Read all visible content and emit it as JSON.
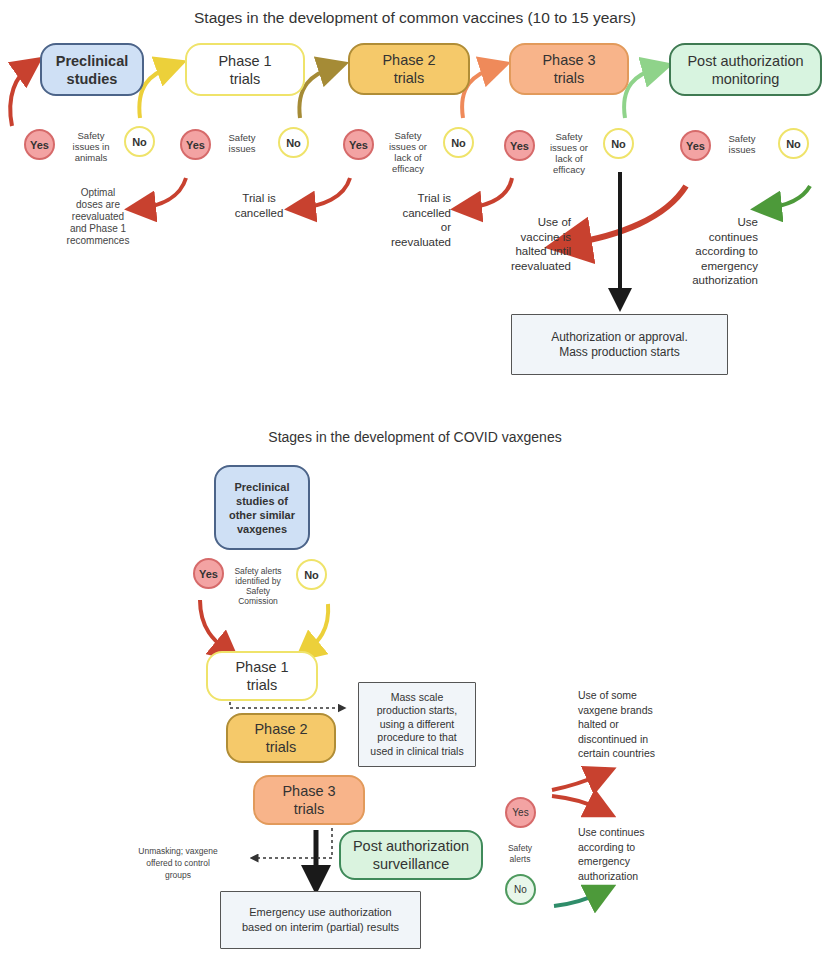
{
  "top": {
    "title": "Stages in the development of common vaccines (10 to 15 years)",
    "stages": [
      {
        "label": "Preclinical studies",
        "line1": "Preclinical",
        "line2": "studies"
      },
      {
        "label": "Phase 1 trials",
        "line1": "Phase 1",
        "line2": "trials"
      },
      {
        "label": "Phase 2 trials",
        "line1": "Phase 2",
        "line2": "trials"
      },
      {
        "label": "Phase 3 trials",
        "line1": "Phase 3",
        "line2": "trials"
      },
      {
        "label": "Post authorization monitoring",
        "line1": "Post authorization",
        "line2": "monitoring"
      }
    ],
    "decisions": [
      {
        "yes": "Yes",
        "no": "No",
        "question": "Safety issues in animals",
        "q_lines": [
          "Safety",
          "issues in",
          "animals"
        ],
        "yes_outcome": [
          "Optimal",
          "doses are",
          "reevaluated",
          "and Phase 1",
          "recommences"
        ]
      },
      {
        "yes": "Yes",
        "no": "No",
        "question": "Safety issues",
        "q_lines": [
          "Safety",
          "issues"
        ],
        "yes_outcome": [
          "Trial is",
          "cancelled"
        ]
      },
      {
        "yes": "Yes",
        "no": "No",
        "question": "Safety issues or lack of efficacy",
        "q_lines": [
          "Safety",
          "issues or",
          "lack of",
          "efficacy"
        ],
        "yes_outcome": [
          "Trial is",
          "cancelled",
          "or",
          "reevaluated"
        ]
      },
      {
        "yes": "Yes",
        "no": "No",
        "question": "Safety issues or lack of efficacy",
        "q_lines": [
          "Safety",
          "issues or",
          "lack of",
          "efficacy"
        ],
        "yes_outcome": [
          "Use of",
          "vaccine is",
          "halted until",
          "reevaluated"
        ]
      },
      {
        "yes": "Yes",
        "no": "No",
        "question": "Safety issues",
        "q_lines": [
          "Safety",
          "issues"
        ],
        "no_outcome": [
          "Use",
          "continues",
          "according to",
          "emergency",
          "authorization"
        ]
      }
    ],
    "final_box": {
      "line1": "Authorization or approval.",
      "line2": "Mass production starts"
    }
  },
  "bottom": {
    "title": "Stages in the development of COVID vaxgenes",
    "preclinical": {
      "lines": [
        "Preclinical",
        "studies of",
        "other similar",
        "vaxgenes"
      ]
    },
    "decision1": {
      "yes": "Yes",
      "no": "No",
      "q_lines": [
        "Safety alerts",
        "identified by",
        "Safety",
        "Comission"
      ]
    },
    "phase1": {
      "line1": "Phase 1",
      "line2": "trials"
    },
    "phase2": {
      "line1": "Phase 2",
      "line2": "trials"
    },
    "phase3": {
      "line1": "Phase 3",
      "line2": "trials"
    },
    "mass_box": {
      "lines": [
        "Mass scale",
        "production starts,",
        "using a different",
        "procedure to that",
        "used in clinical trials"
      ]
    },
    "post_auth": {
      "line1": "Post authorization",
      "line2": "surveillance"
    },
    "unmasking": {
      "lines": [
        "Unmasking; vaxgene",
        "offered to control",
        "groups"
      ]
    },
    "emergency_box": {
      "line1": "Emergency use authorization",
      "line2": "based on interim (partial) results"
    },
    "decision2": {
      "yes": "Yes",
      "no": "No",
      "q_lines": [
        "Safety",
        "alerts"
      ]
    },
    "outcome_halt": {
      "lines": [
        "Use of some",
        "vaxgene brands",
        "halted or",
        "discontinued in",
        "certain countries"
      ]
    },
    "outcome_continue": {
      "lines": [
        "Use continues",
        "according to",
        "emergency",
        "authorization"
      ]
    }
  },
  "colors": {
    "preclinical_fill": "#cfe0f5",
    "phase1_border": "#efe36a",
    "phase2_fill": "#f5c96a",
    "phase3_fill": "#f8b48a",
    "post_auth_fill": "#d8f4e0",
    "yes_fill": "#f3a3a3",
    "arrow_red": "#c8412f",
    "arrow_black": "#1a1a1a"
  }
}
